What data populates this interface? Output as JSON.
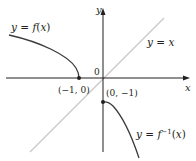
{
  "diagram": {
    "colors": {
      "axes": "#231f20",
      "curve": "#3a3a3a",
      "identity_line": "#c8c8c8",
      "text": "#231f20"
    },
    "axes": {
      "x_label": "x",
      "y_label": "y",
      "origin_label": "0"
    },
    "curves": [
      {
        "id": "f",
        "label": "y = f(x)",
        "prefix": "y = ",
        "func": "f(x)"
      },
      {
        "id": "identity",
        "label": "y = x"
      },
      {
        "id": "f_inverse",
        "label": "y = f⁻¹(x)",
        "prefix": "y = f",
        "sup": "−1",
        "suffix": "(x)"
      }
    ],
    "points": [
      {
        "label": "(−1, 0)",
        "x": -1,
        "y": 0
      },
      {
        "label": "(0, −1)",
        "x": 0,
        "y": -1
      }
    ]
  }
}
